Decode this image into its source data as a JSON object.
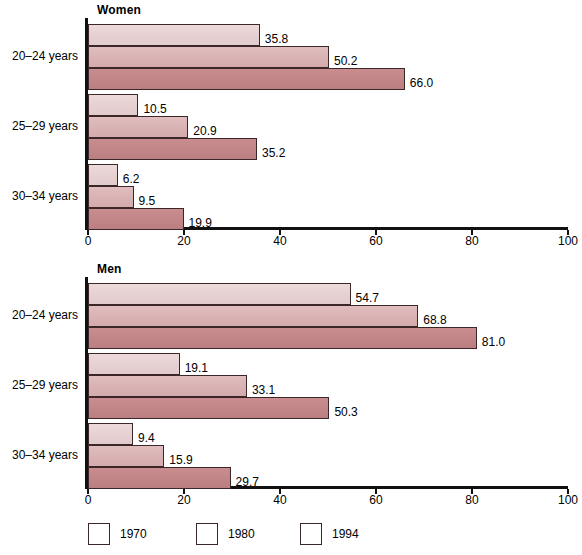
{
  "chart_data": {
    "type": "bar",
    "orientation": "horizontal",
    "panels": [
      {
        "title": "Women",
        "categories": [
          "20–24 years",
          "25–29 years",
          "30–34 years"
        ],
        "series": [
          {
            "name": "1970",
            "values": [
              35.8,
              10.5,
              6.2
            ]
          },
          {
            "name": "1980",
            "values": [
              50.2,
              20.9,
              9.5
            ]
          },
          {
            "name": "1994",
            "values": [
              66.0,
              35.2,
              19.9
            ]
          }
        ],
        "labels": [
          [
            "35.8",
            "50.2",
            "66.0"
          ],
          [
            "10.5",
            "20.9",
            "35.2"
          ],
          [
            "6.2",
            "9.5",
            "19.9"
          ]
        ],
        "xlim": [
          0,
          100
        ],
        "xticks": [
          "0",
          "20",
          "40",
          "60",
          "80",
          "100"
        ],
        "xlabel": "",
        "ylabel": "",
        "grid": false
      },
      {
        "title": "Men",
        "categories": [
          "20–24 years",
          "25–29 years",
          "30–34 years"
        ],
        "series": [
          {
            "name": "1970",
            "values": [
              54.7,
              19.1,
              9.4
            ]
          },
          {
            "name": "1980",
            "values": [
              68.8,
              33.1,
              15.9
            ]
          },
          {
            "name": "1994",
            "values": [
              81.0,
              50.3,
              29.7
            ]
          }
        ],
        "labels": [
          [
            "54.7",
            "68.8",
            "81.0"
          ],
          [
            "19.1",
            "33.1",
            "50.3"
          ],
          [
            "9.4",
            "15.9",
            "29.7"
          ]
        ],
        "xlim": [
          0,
          100
        ],
        "xticks": [
          "0",
          "20",
          "40",
          "60",
          "80",
          "100"
        ],
        "xlabel": "",
        "ylabel": "",
        "grid": false
      }
    ],
    "legend": {
      "position": "bottom",
      "entries": [
        {
          "label": "1970",
          "color": "#e6d0d1"
        },
        {
          "label": "1980",
          "color": "#d9b2b4"
        },
        {
          "label": "1994",
          "color": "#c18588"
        }
      ]
    },
    "colors": {
      "series_1970": "#e6d0d1",
      "series_1980": "#d9b2b4",
      "series_1994": "#c18588",
      "bar_outline": "#3b2628",
      "axis": "#111111",
      "background": "#ffffff"
    }
  }
}
